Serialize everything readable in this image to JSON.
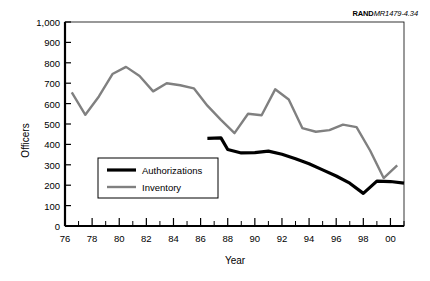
{
  "doc_id": {
    "mark": "RAND",
    "number": "MR1479-4.34"
  },
  "chart_data": {
    "type": "line",
    "title": "",
    "xlabel": "Year",
    "ylabel": "Officers",
    "xlim": [
      1976,
      2001
    ],
    "ylim": [
      0,
      1000
    ],
    "ytick_values": [
      0,
      100,
      200,
      300,
      400,
      500,
      600,
      700,
      800,
      900,
      1000
    ],
    "ytick_labels": [
      "0",
      "100",
      "200",
      "300",
      "400",
      "500",
      "600",
      "700",
      "800",
      "900",
      "1,000"
    ],
    "xtick_values": [
      1976,
      1978,
      1980,
      1982,
      1984,
      1986,
      1988,
      1990,
      1992,
      1994,
      1996,
      1998,
      2000
    ],
    "xtick_labels": [
      "76",
      "78",
      "80",
      "82",
      "84",
      "86",
      "88",
      "90",
      "92",
      "94",
      "96",
      "98",
      "00"
    ],
    "xtick_minor_values": [
      1977,
      1979,
      1981,
      1983,
      1985,
      1987,
      1989,
      1991,
      1993,
      1995,
      1997,
      1999,
      2001
    ],
    "grid": false,
    "legend_position": "lower-left-inside",
    "series": [
      {
        "name": "Authorizations",
        "color": "#000000",
        "linewidth": 3.2,
        "x": [
          1986.5,
          1987.5,
          1988,
          1989,
          1990,
          1991,
          1992,
          1993,
          1994,
          1995,
          1996,
          1997,
          1998,
          1999,
          2000,
          2001
        ],
        "values": [
          430,
          432,
          375,
          358,
          360,
          367,
          352,
          330,
          305,
          275,
          245,
          210,
          160,
          220,
          218,
          210
        ]
      },
      {
        "name": "Inventory",
        "color": "#808080",
        "linewidth": 2.4,
        "x": [
          1976.5,
          1977.5,
          1978.5,
          1979.5,
          1980.5,
          1981.5,
          1982.5,
          1983.5,
          1984.5,
          1985.5,
          1986.5,
          1987.5,
          1988.5,
          1989.5,
          1990.5,
          1991.5,
          1992.5,
          1993.5,
          1994.5,
          1995.5,
          1996.5,
          1997.5,
          1998.5,
          1999.5,
          2000.5
        ],
        "values": [
          655,
          545,
          635,
          745,
          780,
          735,
          660,
          700,
          690,
          675,
          590,
          520,
          455,
          550,
          543,
          670,
          620,
          480,
          462,
          470,
          497,
          485,
          370,
          235,
          297
        ]
      }
    ],
    "legend": [
      {
        "label": "Authorizations",
        "color": "#000000",
        "linewidth": 3.2
      },
      {
        "label": "Inventory",
        "color": "#808080",
        "linewidth": 2.4
      }
    ]
  }
}
